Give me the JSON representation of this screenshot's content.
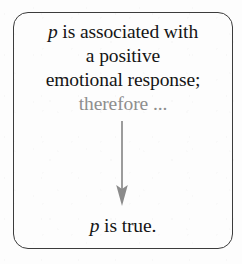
{
  "figure": {
    "name": "argument-diagram",
    "background_color": "#fdfdfd",
    "box": {
      "border_color": "#3c3c3c",
      "corner_radius_px": 15
    }
  },
  "premise": {
    "lines": [
      {
        "id": "line-1",
        "prefix_italic": "p",
        "rest": " is associated with",
        "color": "#151515"
      },
      {
        "id": "line-2",
        "prefix_italic": "",
        "rest": "a positive",
        "color": "#151515"
      },
      {
        "id": "line-3",
        "prefix_italic": "",
        "rest": "emotional response;",
        "color": "#151515"
      },
      {
        "id": "line-4",
        "prefix_italic": "",
        "rest": "therefore ...",
        "color": "#8e8e8e"
      }
    ],
    "line_1_italic": "p",
    "line_1_text": " is associated with",
    "line_2_text": "a positive",
    "line_3_text": "emotional response;",
    "line_4_text": "therefore ..."
  },
  "arrow": {
    "name": "downward-arrow",
    "color": "#8b8b8b",
    "direction": "down"
  },
  "conclusion": {
    "italic": "p",
    "text": " is true.",
    "color": "#151515"
  }
}
